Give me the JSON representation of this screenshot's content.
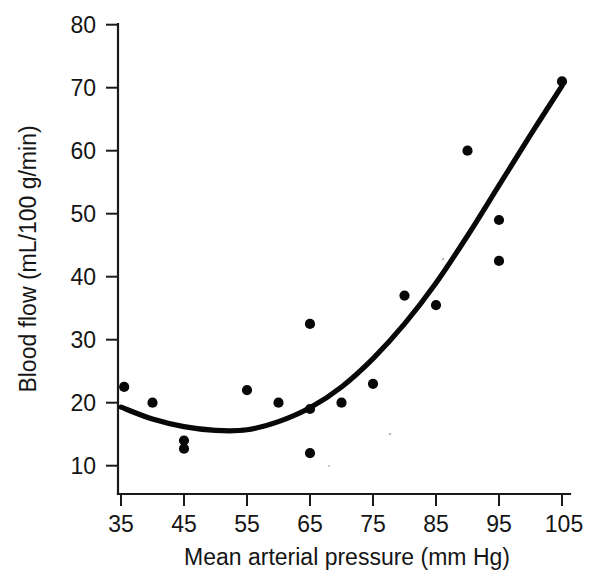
{
  "figure": {
    "background_color": "#ffffff",
    "ink_color": "#080808"
  },
  "chart_data": {
    "type": "scatter",
    "title": "",
    "xlabel": "Mean arterial pressure (mm Hg)",
    "ylabel": "Blood flow (mL/100 g/min)",
    "xlim": [
      30,
      108
    ],
    "ylim": [
      5,
      82
    ],
    "xticks": [
      35,
      45,
      55,
      65,
      75,
      85,
      95,
      105
    ],
    "xtick_labels": [
      "35",
      "45",
      "55",
      "65",
      "75",
      "85",
      "95",
      "105"
    ],
    "yticks": [
      10,
      20,
      30,
      40,
      50,
      60,
      70,
      80
    ],
    "ytick_labels": [
      "10",
      "20",
      "30",
      "40",
      "50",
      "60",
      "70",
      "80"
    ],
    "grid": false,
    "legend": false,
    "legend_position": "none",
    "marker": "filled-circle",
    "marker_color": "#080808",
    "points": [
      {
        "x": 35.5,
        "y": 22.5
      },
      {
        "x": 40.0,
        "y": 20.0
      },
      {
        "x": 45.0,
        "y": 14.0
      },
      {
        "x": 45.0,
        "y": 12.7
      },
      {
        "x": 55.0,
        "y": 22.0
      },
      {
        "x": 60.0,
        "y": 20.0
      },
      {
        "x": 65.0,
        "y": 32.5
      },
      {
        "x": 65.0,
        "y": 19.0
      },
      {
        "x": 65.0,
        "y": 12.0
      },
      {
        "x": 70.0,
        "y": 20.0
      },
      {
        "x": 75.0,
        "y": 23.0
      },
      {
        "x": 80.0,
        "y": 37.0
      },
      {
        "x": 85.0,
        "y": 35.5
      },
      {
        "x": 90.0,
        "y": 60.0
      },
      {
        "x": 95.0,
        "y": 49.0
      },
      {
        "x": 95.0,
        "y": 42.5
      },
      {
        "x": 105.0,
        "y": 71.0
      }
    ],
    "fit_curve": {
      "name": "fitted quadratic trend",
      "color": "#080808",
      "x_start": 35,
      "x_end": 105,
      "minimum_x": 52,
      "minimum_y": 15.5,
      "points": [
        {
          "x": 35,
          "y": 19.3
        },
        {
          "x": 40,
          "y": 17.4
        },
        {
          "x": 45,
          "y": 16.2
        },
        {
          "x": 50,
          "y": 15.6
        },
        {
          "x": 55,
          "y": 15.7
        },
        {
          "x": 60,
          "y": 17.0
        },
        {
          "x": 65,
          "y": 19.2
        },
        {
          "x": 70,
          "y": 22.5
        },
        {
          "x": 75,
          "y": 27.0
        },
        {
          "x": 80,
          "y": 32.5
        },
        {
          "x": 85,
          "y": 39.0
        },
        {
          "x": 90,
          "y": 46.5
        },
        {
          "x": 95,
          "y": 54.5
        },
        {
          "x": 100,
          "y": 62.5
        },
        {
          "x": 105,
          "y": 70.3
        }
      ]
    }
  }
}
